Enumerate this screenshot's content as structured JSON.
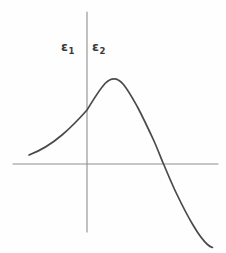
{
  "chart_data": {
    "type": "line",
    "title": "",
    "subtitle": "",
    "xlabel": "",
    "ylabel": "",
    "grid": false,
    "legend_position": "none",
    "annotations": [
      {
        "name": "epsilon-1",
        "symbol": "ε",
        "subscript": "1",
        "x": 62,
        "y": 47,
        "region": "left-of-vertical-axis"
      },
      {
        "name": "epsilon-2",
        "symbol": "ε",
        "subscript": "2",
        "x": 93,
        "y": 47,
        "region": "right-of-vertical-axis"
      }
    ],
    "axes": {
      "x_axis": {
        "y_pixel": 164,
        "x_start": 13,
        "x_end": 218,
        "color": "#8d8d8d"
      },
      "y_axis": {
        "x_pixel": 87,
        "y_start": 12,
        "y_end": 232,
        "color": "#8d8d8d"
      },
      "origin": {
        "x": 87,
        "y": 164
      }
    },
    "series": [
      {
        "name": "resonance-curve",
        "color": "#4a4a4a",
        "points": [
          {
            "x": 29,
            "y": 155
          },
          {
            "x": 40,
            "y": 150
          },
          {
            "x": 52,
            "y": 143
          },
          {
            "x": 62,
            "y": 135
          },
          {
            "x": 71,
            "y": 126
          },
          {
            "x": 79,
            "y": 118
          },
          {
            "x": 87,
            "y": 110
          },
          {
            "x": 94,
            "y": 99
          },
          {
            "x": 100,
            "y": 90
          },
          {
            "x": 106,
            "y": 83
          },
          {
            "x": 111,
            "y": 79
          },
          {
            "x": 117,
            "y": 79
          },
          {
            "x": 123,
            "y": 83
          },
          {
            "x": 129,
            "y": 91
          },
          {
            "x": 136,
            "y": 103
          },
          {
            "x": 144,
            "y": 119
          },
          {
            "x": 152,
            "y": 137
          },
          {
            "x": 163,
            "y": 164
          },
          {
            "x": 174,
            "y": 189
          },
          {
            "x": 186,
            "y": 212
          },
          {
            "x": 198,
            "y": 231
          },
          {
            "x": 206,
            "y": 241
          },
          {
            "x": 212,
            "y": 247
          }
        ],
        "features": {
          "peak_x": 111,
          "peak_y": 79,
          "zero_crossing_x": 163,
          "y_axis_crossing_y": 110,
          "left_tail_start": {
            "x": 29,
            "y": 155
          },
          "right_tail_end": {
            "x": 212,
            "y": 247
          }
        }
      }
    ],
    "colors": {
      "background": "#fefefe",
      "axis": "#8d8d8d",
      "curve": "#4a4a4a",
      "label_text": "#3a3a3a"
    }
  }
}
